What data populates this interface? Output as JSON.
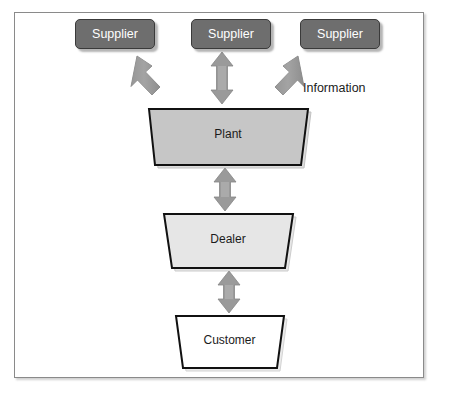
{
  "figure": {
    "type": "supply-chain-flow-diagram",
    "background_color": "#ffffff",
    "frame_border_color": "#8a8a8a"
  },
  "nodes": {
    "suppliers": [
      {
        "label": "Supplier",
        "shape": "rounded-rectangle",
        "fill": "#6e6e6e",
        "text_color": "#ffffff"
      },
      {
        "label": "Supplier",
        "shape": "rounded-rectangle",
        "fill": "#6e6e6e",
        "text_color": "#ffffff"
      },
      {
        "label": "Supplier",
        "shape": "rounded-rectangle",
        "fill": "#6e6e6e",
        "text_color": "#ffffff"
      }
    ],
    "plant": {
      "label": "Plant",
      "shape": "trapezoid",
      "fill": "#c6c6c6",
      "text_color": "#1b1b1b"
    },
    "dealer": {
      "label": "Dealer",
      "shape": "trapezoid",
      "fill": "#e6e6e6",
      "text_color": "#1b1b1b"
    },
    "customer": {
      "label": "Customer",
      "shape": "trapezoid",
      "fill": "#ffffff",
      "text_color": "#1b1b1b"
    }
  },
  "annotations": {
    "information": "Information"
  },
  "connectors": [
    {
      "name": "supplier-1-to-plant",
      "style": "double-headed-arrow",
      "direction": "diagonal",
      "color": "#8f8f8f"
    },
    {
      "name": "supplier-2-to-plant",
      "style": "double-headed-arrow",
      "direction": "vertical",
      "color": "#8f8f8f"
    },
    {
      "name": "supplier-3-to-plant",
      "style": "double-headed-arrow",
      "direction": "diagonal",
      "color": "#8f8f8f"
    },
    {
      "name": "plant-to-dealer",
      "style": "double-headed-arrow",
      "direction": "vertical",
      "color": "#8f8f8f"
    },
    {
      "name": "dealer-to-customer",
      "style": "double-headed-arrow",
      "direction": "vertical",
      "color": "#8f8f8f"
    }
  ]
}
